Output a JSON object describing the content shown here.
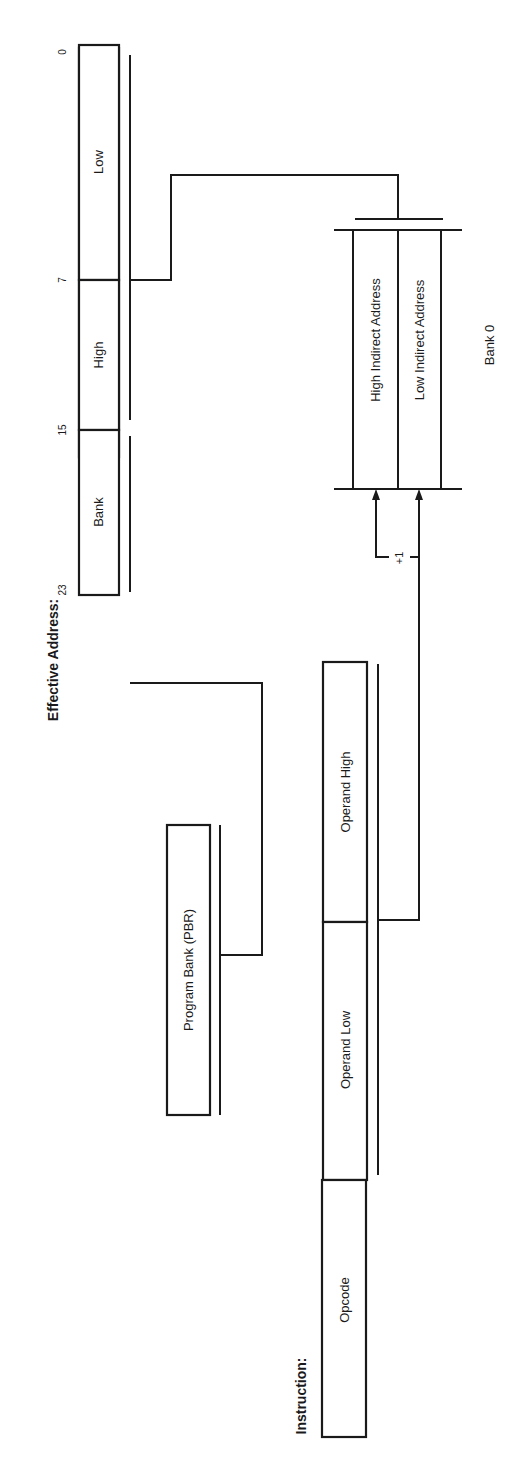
{
  "effective_address": {
    "title": "Effective Address:",
    "fields": [
      {
        "label": "Low"
      },
      {
        "label": "High"
      },
      {
        "label": "Bank"
      }
    ],
    "bit_labels": [
      "0",
      "7",
      "15",
      "23"
    ]
  },
  "program_bank": {
    "label": "Program Bank (PBR)"
  },
  "bank0": {
    "label": "Bank 0",
    "cells": [
      {
        "label": "High Indirect Address"
      },
      {
        "label": "Low Indirect Address"
      }
    ],
    "increment_label": "+1"
  },
  "instruction": {
    "title": "Instruction:",
    "fields": [
      {
        "label": "Opcode"
      },
      {
        "label": "Operand Low"
      },
      {
        "label": "Operand High"
      }
    ]
  },
  "colors": {
    "line": "#1a1a1a",
    "background": "#ffffff"
  }
}
